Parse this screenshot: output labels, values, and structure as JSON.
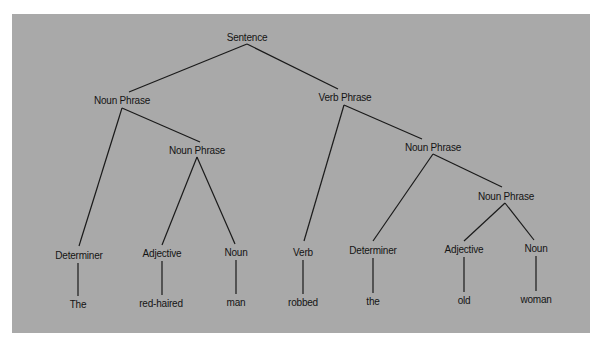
{
  "diagram": {
    "type": "parse-tree",
    "background_color": "#a9a9a9",
    "nodes": [
      {
        "id": "s",
        "label": "Sentence",
        "x": 247,
        "y": 37,
        "kind": "root"
      },
      {
        "id": "np1",
        "label": "Noun Phrase",
        "x": 122,
        "y": 100,
        "kind": "phrase"
      },
      {
        "id": "vp",
        "label": "Verb Phrase",
        "x": 345,
        "y": 97,
        "kind": "phrase"
      },
      {
        "id": "np2",
        "label": "Noun Phrase",
        "x": 197,
        "y": 150,
        "kind": "phrase"
      },
      {
        "id": "np3",
        "label": "Noun Phrase",
        "x": 433,
        "y": 147,
        "kind": "phrase"
      },
      {
        "id": "np4",
        "label": "Noun Phrase",
        "x": 506,
        "y": 196,
        "kind": "phrase"
      },
      {
        "id": "det1",
        "label": "Determiner",
        "x": 79,
        "y": 255,
        "kind": "pos"
      },
      {
        "id": "adj1",
        "label": "Adjective",
        "x": 162,
        "y": 253,
        "kind": "pos"
      },
      {
        "id": "n1",
        "label": "Noun",
        "x": 236,
        "y": 252,
        "kind": "pos"
      },
      {
        "id": "v1",
        "label": "Verb",
        "x": 303,
        "y": 252,
        "kind": "pos"
      },
      {
        "id": "det2",
        "label": "Determiner",
        "x": 373,
        "y": 250,
        "kind": "pos"
      },
      {
        "id": "adj2",
        "label": "Adjective",
        "x": 464,
        "y": 249,
        "kind": "pos"
      },
      {
        "id": "n2",
        "label": "Noun",
        "x": 536,
        "y": 248,
        "kind": "pos"
      },
      {
        "id": "w1",
        "label": "The",
        "x": 78,
        "y": 304,
        "kind": "word"
      },
      {
        "id": "w2",
        "label": "red-haired",
        "x": 161,
        "y": 303,
        "kind": "word"
      },
      {
        "id": "w3",
        "label": "man",
        "x": 236,
        "y": 302,
        "kind": "word"
      },
      {
        "id": "w4",
        "label": "robbed",
        "x": 303,
        "y": 302,
        "kind": "word"
      },
      {
        "id": "w5",
        "label": "the",
        "x": 373,
        "y": 301,
        "kind": "word"
      },
      {
        "id": "w6",
        "label": "old",
        "x": 464,
        "y": 300,
        "kind": "word"
      },
      {
        "id": "w7",
        "label": "woman",
        "x": 536,
        "y": 299,
        "kind": "word"
      }
    ],
    "edges": [
      {
        "from": "s",
        "to": "np1",
        "x1": 247,
        "y1": 44,
        "x2": 129,
        "y2": 92
      },
      {
        "from": "s",
        "to": "vp",
        "x1": 247,
        "y1": 44,
        "x2": 338,
        "y2": 89
      },
      {
        "from": "np1",
        "to": "det1",
        "x1": 122,
        "y1": 108,
        "x2": 79,
        "y2": 246
      },
      {
        "from": "np1",
        "to": "np2",
        "x1": 122,
        "y1": 108,
        "x2": 200,
        "y2": 142
      },
      {
        "from": "np2",
        "to": "adj1",
        "x1": 197,
        "y1": 157,
        "x2": 162,
        "y2": 245
      },
      {
        "from": "np2",
        "to": "n1",
        "x1": 197,
        "y1": 157,
        "x2": 235,
        "y2": 244
      },
      {
        "from": "vp",
        "to": "v1",
        "x1": 344,
        "y1": 105,
        "x2": 304,
        "y2": 241
      },
      {
        "from": "vp",
        "to": "np3",
        "x1": 344,
        "y1": 105,
        "x2": 422,
        "y2": 139
      },
      {
        "from": "np3",
        "to": "det2",
        "x1": 433,
        "y1": 154,
        "x2": 373,
        "y2": 241
      },
      {
        "from": "np3",
        "to": "np4",
        "x1": 433,
        "y1": 154,
        "x2": 502,
        "y2": 187
      },
      {
        "from": "np4",
        "to": "adj2",
        "x1": 505,
        "y1": 203,
        "x2": 464,
        "y2": 241
      },
      {
        "from": "np4",
        "to": "n2",
        "x1": 505,
        "y1": 203,
        "x2": 534,
        "y2": 240
      },
      {
        "from": "det1",
        "to": "w1",
        "x1": 78,
        "y1": 263,
        "x2": 78,
        "y2": 296
      },
      {
        "from": "adj1",
        "to": "w2",
        "x1": 162,
        "y1": 261,
        "x2": 162,
        "y2": 295
      },
      {
        "from": "n1",
        "to": "w3",
        "x1": 236,
        "y1": 260,
        "x2": 236,
        "y2": 294
      },
      {
        "from": "v1",
        "to": "w4",
        "x1": 303,
        "y1": 260,
        "x2": 303,
        "y2": 294
      },
      {
        "from": "det2",
        "to": "w5",
        "x1": 373,
        "y1": 258,
        "x2": 373,
        "y2": 293
      },
      {
        "from": "adj2",
        "to": "w6",
        "x1": 464,
        "y1": 257,
        "x2": 464,
        "y2": 292
      },
      {
        "from": "n2",
        "to": "w7",
        "x1": 536,
        "y1": 256,
        "x2": 536,
        "y2": 291
      }
    ]
  }
}
